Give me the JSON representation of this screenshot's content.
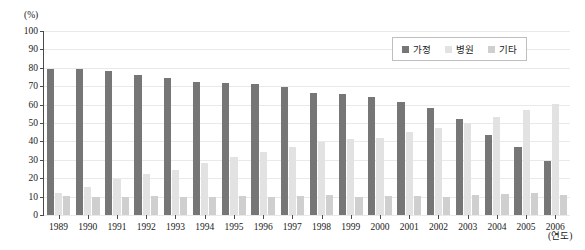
{
  "chart_data": {
    "type": "bar",
    "title": "",
    "xlabel": "(연도)",
    "ylabel": "(%)",
    "ylim": [
      0,
      100
    ],
    "ytick_step": 10,
    "grid": true,
    "legend_position": "top-right",
    "categories": [
      "1989",
      "1990",
      "1991",
      "1992",
      "1993",
      "1994",
      "1995",
      "1996",
      "1997",
      "1998",
      "1999",
      "2000",
      "2001",
      "2002",
      "2003",
      "2004",
      "2005",
      "2006"
    ],
    "series": [
      {
        "name": "가정",
        "color": "#767676",
        "values": [
          79.5,
          79.4,
          78.3,
          76.3,
          74.6,
          72.1,
          71.8,
          71.3,
          69.6,
          66.4,
          65.6,
          64.4,
          61.5,
          58.1,
          52.2,
          43.5,
          37.1,
          29.1
        ]
      },
      {
        "name": "병원",
        "color": "#e2e2e2",
        "values": [
          12.1,
          15.4,
          19.8,
          22.2,
          24.7,
          28.5,
          31.6,
          34.5,
          36.8,
          39.8,
          41.1,
          42.1,
          45.0,
          47.4,
          49.8,
          53.5,
          57.3,
          60.4
        ]
      },
      {
        "name": "기타",
        "color": "#cfcfcf",
        "values": [
          10.1,
          10.0,
          10.0,
          10.1,
          10.0,
          10.0,
          10.1,
          10.0,
          10.5,
          11.1,
          10.0,
          10.1,
          10.1,
          10.0,
          10.7,
          11.4,
          12.0,
          11.1
        ]
      }
    ],
    "ytick_labels": [
      "0",
      "10",
      "20",
      "30",
      "40",
      "50",
      "60",
      "70",
      "80",
      "90",
      "100"
    ]
  },
  "legend": {
    "items": [
      {
        "label": "가정"
      },
      {
        "label": "병원"
      },
      {
        "label": "기타"
      }
    ]
  }
}
